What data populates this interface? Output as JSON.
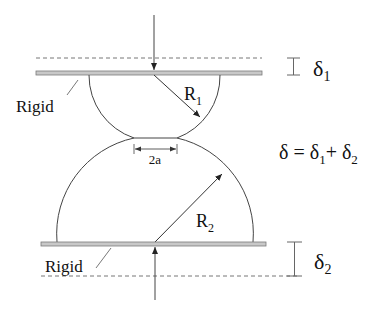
{
  "diagram": {
    "type": "hertz-contact-schematic",
    "labels": {
      "rigid_top": "Rigid",
      "rigid_bottom": "Rigid",
      "radius_top": "R",
      "radius_top_sub": "1",
      "radius_bottom": "R",
      "radius_bottom_sub": "2",
      "contact_width": "2a",
      "delta_1": "δ",
      "delta_1_sub": "1",
      "delta_2": "δ",
      "delta_2_sub": "2",
      "equation_lhs": "δ = δ",
      "equation_sub1": "1",
      "equation_plus": "+ δ",
      "equation_sub2": "2"
    },
    "colors": {
      "line": "#444444",
      "plate_fill": "#c8c8c8",
      "plate_stroke": "#7a7a7a",
      "dashed": "#777777",
      "text": "#111111"
    }
  }
}
